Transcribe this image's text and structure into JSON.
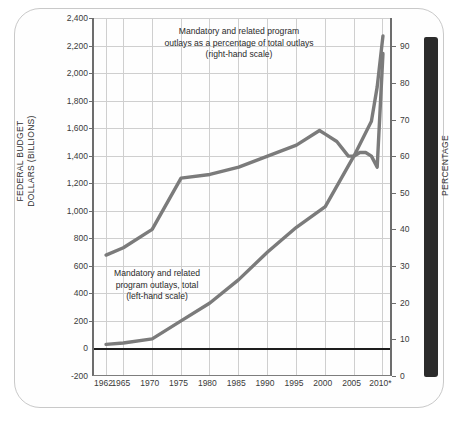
{
  "page": {
    "edge_tab_color": "#2b2b2b",
    "card_background": "#fefefe"
  },
  "chart_data": {
    "type": "line",
    "title": "",
    "subtitle": "",
    "xlabel": "",
    "ylabel": "FEDERAL BUDGET\nDOLLARS (BILLIONS)",
    "ylabel_secondary": "PERCENTAGE",
    "grid": true,
    "legend_position": "inline-annotations",
    "x_tick_labels": [
      "1962",
      "1965",
      "1970",
      "1975",
      "1980",
      "1985",
      "1990",
      "1995",
      "2000",
      "2005",
      "2010*"
    ],
    "x_tick_values": [
      1962,
      1965,
      1970,
      1975,
      1980,
      1985,
      1990,
      1995,
      2000,
      2005,
      2010
    ],
    "xlim": [
      1960,
      2012
    ],
    "ylim": [
      -200,
      2400
    ],
    "y_tick_labels": [
      "2,400",
      "2,200",
      "2,000",
      "1,800",
      "1,600",
      "1,400",
      "1,200",
      "1,000",
      "800",
      "600",
      "400",
      "200",
      "0",
      "-200"
    ],
    "y_tick_values": [
      2400,
      2200,
      2000,
      1800,
      1600,
      1400,
      1200,
      1000,
      800,
      600,
      400,
      200,
      0,
      -200
    ],
    "ylim_secondary": [
      0,
      97.7
    ],
    "y_tick_labels_secondary": [
      "90",
      "80",
      "70",
      "60",
      "50",
      "40",
      "30",
      "20",
      "10",
      "0"
    ],
    "y_tick_values_secondary": [
      90,
      80,
      70,
      60,
      50,
      40,
      30,
      20,
      10,
      0
    ],
    "series_color": "#7b7b7b",
    "series": [
      {
        "name": "Mandatory and related program outlays as a percentage of total outlays",
        "axis": "right",
        "unit": "percent",
        "x": [
          1962,
          1965,
          1970,
          1975,
          1980,
          1985,
          1990,
          1995,
          1999,
          2000,
          2002,
          2004,
          2005,
          2006,
          2007,
          2008,
          2009,
          2010
        ],
        "values": [
          33,
          35,
          40,
          54,
          55,
          57,
          60,
          63,
          67,
          66,
          64,
          60,
          60,
          61,
          61,
          60,
          57,
          88
        ]
      },
      {
        "name": "Mandatory and related program outlays, total",
        "axis": "left",
        "unit": "billions of dollars",
        "x": [
          1962,
          1965,
          1970,
          1975,
          1980,
          1985,
          1990,
          1995,
          2000,
          2005,
          2008,
          2009,
          2010
        ],
        "values": [
          30,
          40,
          70,
          200,
          330,
          500,
          700,
          880,
          1030,
          1400,
          1650,
          1900,
          2270
        ]
      }
    ],
    "annotations": [
      {
        "id": "annotation-percentage",
        "text": "Mandatory and related program\noutlays as a percentage of total outlays\n(right-hand scale)"
      },
      {
        "id": "annotation-dollars",
        "text": "Mandatory and related\nprogram outlays, total\n(left-hand scale)"
      }
    ]
  }
}
